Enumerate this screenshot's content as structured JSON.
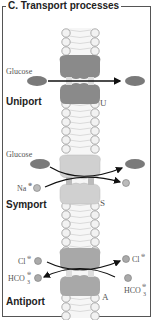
{
  "title": "C. Transport processes",
  "colors": {
    "uniport_protein": "#8a8a8a",
    "symport_protein": "#d0d0d0",
    "antiport_protein": "#a8a8a8",
    "glucose": "#7a7a7a",
    "ion": "#b8b8b8",
    "lipid_head": "#f0f0f0",
    "frame": "#555555"
  },
  "sections": [
    {
      "name": "Uniport",
      "label": "Uniport",
      "protein_letter": "U",
      "substrates": [
        {
          "label": "Glucose",
          "side": "left"
        }
      ]
    },
    {
      "name": "Symport",
      "label": "Symport",
      "protein_letter": "S",
      "substrates": [
        {
          "label": "Glucose",
          "side": "left"
        },
        {
          "label": "Na",
          "charge": "⊕",
          "side": "left"
        }
      ]
    },
    {
      "name": "Antiport",
      "label": "Antiport",
      "protein_letter": "A",
      "substrates": [
        {
          "label": "Cl",
          "charge": "⊖",
          "side": "both"
        },
        {
          "label": "HCO",
          "subscript": "3",
          "charge": "⊖",
          "side": "both"
        }
      ]
    }
  ]
}
